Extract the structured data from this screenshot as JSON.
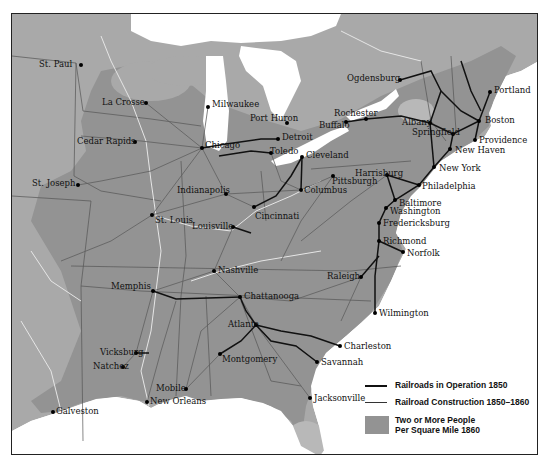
{
  "map": {
    "title": "Railroads 1850-1860",
    "colors": {
      "land": "#a9a9a9",
      "dense_population": "#939393",
      "water": "#ffffff",
      "railroad_1850": "#111111",
      "railroad_construction": "#5e5e5e",
      "rivers": "#e8e8e8",
      "state_borders": "#555555",
      "light_patch": "#bdbdbd"
    },
    "cities": [
      {
        "name": "St. Paul",
        "x": 80,
        "y": 64,
        "label_side": "left"
      },
      {
        "name": "La Crosse",
        "x": 145,
        "y": 102,
        "label_side": "left"
      },
      {
        "name": "Cedar Rapids",
        "x": 134,
        "y": 141,
        "label_side": "left"
      },
      {
        "name": "Milwaukee",
        "x": 207,
        "y": 106,
        "label_side": "right"
      },
      {
        "name": "Chicago",
        "x": 201,
        "y": 147,
        "label_side": "right-upper"
      },
      {
        "name": "Port Huron",
        "x": 286,
        "y": 122,
        "label_side": "left-upper"
      },
      {
        "name": "Detroit",
        "x": 277,
        "y": 138,
        "label_side": "right"
      },
      {
        "name": "Toledo",
        "x": 270,
        "y": 152,
        "label_side": "right"
      },
      {
        "name": "Cleveland",
        "x": 301,
        "y": 156,
        "label_side": "right"
      },
      {
        "name": "Ogdensburg",
        "x": 399,
        "y": 79,
        "label_side": "left"
      },
      {
        "name": "Rochester",
        "x": 365,
        "y": 118,
        "label_side": "left-upper"
      },
      {
        "name": "Buffalo",
        "x": 345,
        "y": 121,
        "label_side": "left"
      },
      {
        "name": "Albany",
        "x": 429,
        "y": 122,
        "label_side": "left"
      },
      {
        "name": "Portland",
        "x": 489,
        "y": 91,
        "label_side": "right"
      },
      {
        "name": "Boston",
        "x": 478,
        "y": 120,
        "label_side": "right"
      },
      {
        "name": "Springfield",
        "x": 452,
        "y": 133,
        "label_side": "left"
      },
      {
        "name": "Providence",
        "x": 474,
        "y": 139,
        "label_side": "right"
      },
      {
        "name": "New Haven",
        "x": 449,
        "y": 148,
        "label_side": "right"
      },
      {
        "name": "New York",
        "x": 433,
        "y": 166,
        "label_side": "right"
      },
      {
        "name": "Harrisburg",
        "x": 386,
        "y": 174,
        "label_side": "left-upper"
      },
      {
        "name": "Pittsburgh",
        "x": 332,
        "y": 175,
        "label_side": "right"
      },
      {
        "name": "Philadelphia",
        "x": 418,
        "y": 184,
        "label_side": "right"
      },
      {
        "name": "Columbus",
        "x": 300,
        "y": 189,
        "label_side": "right"
      },
      {
        "name": "Indianapolis",
        "x": 225,
        "y": 193,
        "label_side": "left"
      },
      {
        "name": "St. Joseph",
        "x": 77,
        "y": 184,
        "label_side": "left"
      },
      {
        "name": "Cincinnati",
        "x": 253,
        "y": 206,
        "label_side": "right-lower"
      },
      {
        "name": "St. Louis",
        "x": 151,
        "y": 214,
        "label_side": "right"
      },
      {
        "name": "Baltimore",
        "x": 394,
        "y": 199,
        "label_side": "right"
      },
      {
        "name": "Washington",
        "x": 385,
        "y": 207,
        "label_side": "right"
      },
      {
        "name": "Fredericksburg",
        "x": 378,
        "y": 222,
        "label_side": "right"
      },
      {
        "name": "Louisville",
        "x": 232,
        "y": 226,
        "label_side": "left"
      },
      {
        "name": "Richmond",
        "x": 378,
        "y": 240,
        "label_side": "right"
      },
      {
        "name": "Norfolk",
        "x": 402,
        "y": 251,
        "label_side": "right"
      },
      {
        "name": "Nashville",
        "x": 213,
        "y": 270,
        "label_side": "right"
      },
      {
        "name": "Raleigh",
        "x": 360,
        "y": 276,
        "label_side": "left"
      },
      {
        "name": "Memphis",
        "x": 152,
        "y": 290,
        "label_side": "left-upper"
      },
      {
        "name": "Chattanooga",
        "x": 239,
        "y": 296,
        "label_side": "right"
      },
      {
        "name": "Wilmington",
        "x": 374,
        "y": 312,
        "label_side": "right"
      },
      {
        "name": "Atlanta",
        "x": 255,
        "y": 324,
        "label_side": "left"
      },
      {
        "name": "Charleston",
        "x": 339,
        "y": 345,
        "label_side": "right"
      },
      {
        "name": "Vicksburg",
        "x": 135,
        "y": 352,
        "label_side": "left"
      },
      {
        "name": "Montgomery",
        "x": 219,
        "y": 353,
        "label_side": "right-lower"
      },
      {
        "name": "Savannah",
        "x": 316,
        "y": 361,
        "label_side": "right"
      },
      {
        "name": "Natchez",
        "x": 122,
        "y": 366,
        "label_side": "left"
      },
      {
        "name": "Mobile",
        "x": 185,
        "y": 388,
        "label_side": "left"
      },
      {
        "name": "Jacksonville",
        "x": 309,
        "y": 397,
        "label_side": "right"
      },
      {
        "name": "New Orleans",
        "x": 146,
        "y": 401,
        "label_side": "right"
      },
      {
        "name": "Galveston",
        "x": 52,
        "y": 411,
        "label_side": "right"
      }
    ]
  },
  "legend": {
    "items": [
      {
        "label": "Railroads in Operation 1850",
        "symbol": "thick-line"
      },
      {
        "label": "Railroad Construction 1850–1860",
        "symbol": "thin-line"
      },
      {
        "label_line1": "Two or More People",
        "label_line2": "Per Square Mile 1860",
        "symbol": "gray-swatch"
      }
    ]
  }
}
